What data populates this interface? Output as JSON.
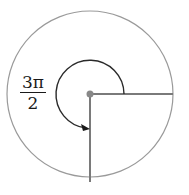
{
  "diagram": {
    "angle_label": {
      "numerator": "3π",
      "denominator": "2"
    },
    "colors": {
      "circle": "#8c8c8c",
      "rays": "#7a7a7a",
      "arc": "#2a2a2a",
      "center_dot": "#888888"
    }
  }
}
